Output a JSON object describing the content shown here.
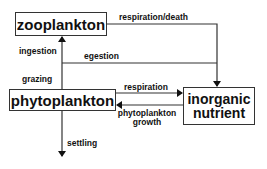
{
  "diagram": {
    "nodes": {
      "zooplankton": "zooplankton",
      "phytoplankton": "phytoplankton",
      "nutrient_line1": "inorganic",
      "nutrient_line2": "nutrient"
    },
    "edges": {
      "respiration_death": "respiration/death",
      "egestion": "egestion",
      "ingestion": "ingestion",
      "grazing": "grazing",
      "respiration": "respiration",
      "growth_line1": "phytoplankton",
      "growth_line2": "growth",
      "settling": "settling"
    },
    "colors": {
      "line": "#333333",
      "text": "#111111",
      "background": "#ffffff"
    }
  }
}
